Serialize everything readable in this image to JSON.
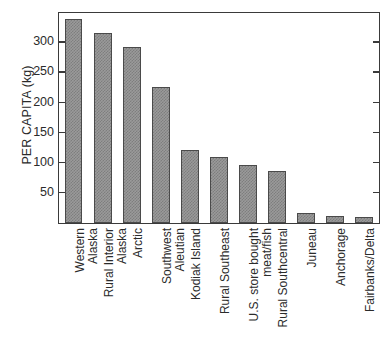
{
  "chart_data": {
    "type": "bar",
    "title": "",
    "xlabel": "",
    "ylabel": "PER CAPITA (kg)",
    "ylim": [
      0,
      347
    ],
    "yticks": [
      50,
      100,
      150,
      200,
      250,
      300
    ],
    "ytick_labels": [
      "50",
      "100",
      "150",
      "200",
      "250",
      "300"
    ],
    "grid": false,
    "legend": null,
    "bar_color": "#9a9a9a",
    "bar_edge_color": "#4a4a4a",
    "axis_color": "#3a3a3a",
    "categories": [
      "Western Alaska",
      "Rural Interior Alaska",
      "Arctic",
      "Southwest Aleutian",
      "Kodiak Island",
      "Rural Southeast",
      "U.S. store bought meat/fish",
      "Rural Southcentral",
      "Juneau",
      "Anchorage",
      "Fairbanks/Delta"
    ],
    "category_label_lines": [
      [
        "Western",
        "Alaska"
      ],
      [
        "Rural Interior",
        "Alaska"
      ],
      [
        "Arctic"
      ],
      [
        "Southwest",
        "Aleutian"
      ],
      [
        "Kodiak Island"
      ],
      [
        "Rural Southeast"
      ],
      [
        "U.S. store bought",
        "meat/fish"
      ],
      [
        "Rural Southcentral"
      ],
      [
        "Juneau"
      ],
      [
        "Anchorage"
      ],
      [
        "Fairbanks/Delta"
      ]
    ],
    "values": [
      338,
      316,
      292,
      226,
      121,
      109,
      96,
      87,
      16,
      11,
      10
    ]
  }
}
